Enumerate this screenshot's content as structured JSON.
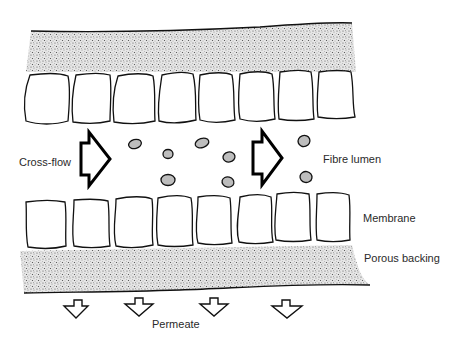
{
  "diagram": {
    "type": "cross-section schematic",
    "labels": {
      "cross_flow": "Cross-flow",
      "fibre_lumen": "Fibre lumen",
      "membrane": "Membrane",
      "porous_backing": "Porous backing",
      "permeate": "Permeate"
    },
    "layers": [
      {
        "name": "Porous backing (top)",
        "style": "stippled"
      },
      {
        "name": "Membrane (top)",
        "cell_count": 8
      },
      {
        "name": "Fibre lumen",
        "contents": "suspended particles",
        "particle_count": 8
      },
      {
        "name": "Membrane (bottom)",
        "cell_count": 8
      },
      {
        "name": "Porous backing (bottom)",
        "style": "stippled"
      }
    ],
    "flow_arrows": {
      "cross_flow_count": 2,
      "permeate_count": 4
    },
    "colors": {
      "ink": "#111111",
      "stipple": "#8a8a8a",
      "background": "#ffffff"
    }
  }
}
